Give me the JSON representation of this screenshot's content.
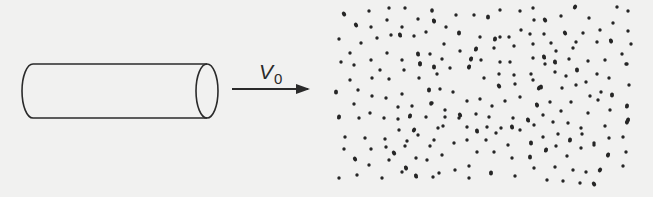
{
  "diagram": {
    "type": "physics-schematic",
    "colors": {
      "background": "#f1f1f0",
      "stroke": "#2a2a2a",
      "dots": "#262626"
    },
    "cylinder": {
      "x_left": 22,
      "x_right": 207,
      "y_top": 64,
      "y_bottom": 118,
      "cap_rx": 11
    },
    "arrow": {
      "x_start": 232,
      "x_end": 308,
      "y": 89,
      "label_main": "V",
      "label_sub": "0"
    },
    "particles": [
      [
        344,
        14
      ],
      [
        369,
        11
      ],
      [
        389,
        8
      ],
      [
        405,
        8
      ],
      [
        432,
        11
      ],
      [
        356,
        25
      ],
      [
        371,
        27
      ],
      [
        387,
        20
      ],
      [
        402,
        27
      ],
      [
        418,
        19
      ],
      [
        434,
        21
      ],
      [
        339,
        39
      ],
      [
        361,
        43
      ],
      [
        377,
        38
      ],
      [
        391,
        35
      ],
      [
        400,
        35
      ],
      [
        414,
        36
      ],
      [
        426,
        32
      ],
      [
        350,
        53
      ],
      [
        387,
        53
      ],
      [
        418,
        54
      ],
      [
        430,
        54
      ],
      [
        341,
        62
      ],
      [
        371,
        60
      ],
      [
        402,
        60
      ],
      [
        420,
        64
      ],
      [
        432,
        10
      ],
      [
        434,
        21
      ],
      [
        456,
        15
      ],
      [
        474,
        15
      ],
      [
        488,
        17
      ],
      [
        500,
        10
      ],
      [
        520,
        11
      ],
      [
        533,
        8
      ],
      [
        446,
        27
      ],
      [
        459,
        33
      ],
      [
        500,
        37
      ],
      [
        521,
        30
      ],
      [
        534,
        20
      ],
      [
        480,
        37
      ],
      [
        495,
        39
      ],
      [
        509,
        37
      ],
      [
        530,
        34
      ],
      [
        444,
        44
      ],
      [
        460,
        51
      ],
      [
        476,
        49
      ],
      [
        494,
        48
      ],
      [
        514,
        46
      ],
      [
        533,
        44
      ],
      [
        442,
        59
      ],
      [
        471,
        59
      ],
      [
        481,
        60
      ],
      [
        500,
        62
      ],
      [
        510,
        62
      ],
      [
        533,
        58
      ],
      [
        575,
        7
      ],
      [
        617,
        7
      ],
      [
        628,
        11
      ],
      [
        589,
        18
      ],
      [
        561,
        16
      ],
      [
        545,
        20
      ],
      [
        613,
        23
      ],
      [
        600,
        30
      ],
      [
        628,
        31
      ],
      [
        544,
        34
      ],
      [
        565,
        33
      ],
      [
        583,
        33
      ],
      [
        551,
        43
      ],
      [
        576,
        42
      ],
      [
        597,
        42
      ],
      [
        611,
        41
      ],
      [
        631,
        44
      ],
      [
        556,
        51
      ],
      [
        573,
        48
      ],
      [
        622,
        54
      ],
      [
        544,
        57
      ],
      [
        569,
        59
      ],
      [
        588,
        61
      ],
      [
        605,
        60
      ],
      [
        626,
        64
      ],
      [
        555,
        62
      ],
      [
        354,
        65
      ],
      [
        380,
        70
      ],
      [
        404,
        70
      ],
      [
        420,
        63
      ],
      [
        434,
        67
      ],
      [
        350,
        80
      ],
      [
        372,
        78
      ],
      [
        389,
        79
      ],
      [
        419,
        78
      ],
      [
        336,
        92
      ],
      [
        358,
        90
      ],
      [
        372,
        96
      ],
      [
        386,
        98
      ],
      [
        402,
        94
      ],
      [
        429,
        90
      ],
      [
        354,
        104
      ],
      [
        398,
        107
      ],
      [
        412,
        106
      ],
      [
        431,
        104
      ],
      [
        339,
        117
      ],
      [
        359,
        118
      ],
      [
        370,
        113
      ],
      [
        384,
        118
      ],
      [
        398,
        119
      ],
      [
        410,
        116
      ],
      [
        426,
        117
      ],
      [
        432,
        103
      ],
      [
        437,
        74
      ],
      [
        450,
        68
      ],
      [
        469,
        67
      ],
      [
        484,
        78
      ],
      [
        499,
        74
      ],
      [
        514,
        75
      ],
      [
        531,
        74
      ],
      [
        539,
        88
      ],
      [
        440,
        89
      ],
      [
        453,
        92
      ],
      [
        467,
        101
      ],
      [
        480,
        99
      ],
      [
        499,
        86
      ],
      [
        515,
        84
      ],
      [
        533,
        80
      ],
      [
        431,
        103
      ],
      [
        445,
        110
      ],
      [
        460,
        115
      ],
      [
        476,
        114
      ],
      [
        492,
        106
      ],
      [
        505,
        101
      ],
      [
        520,
        97
      ],
      [
        537,
        105
      ],
      [
        445,
        117
      ],
      [
        459,
        118
      ],
      [
        489,
        117
      ],
      [
        513,
        118
      ],
      [
        528,
        120
      ],
      [
        443,
        126
      ],
      [
        467,
        127
      ],
      [
        487,
        127
      ],
      [
        501,
        128
      ],
      [
        512,
        127
      ],
      [
        534,
        125
      ],
      [
        545,
        64
      ],
      [
        555,
        72
      ],
      [
        566,
        76
      ],
      [
        577,
        70
      ],
      [
        586,
        82
      ],
      [
        597,
        74
      ],
      [
        609,
        78
      ],
      [
        627,
        64
      ],
      [
        541,
        87
      ],
      [
        562,
        88
      ],
      [
        576,
        85
      ],
      [
        590,
        96
      ],
      [
        601,
        92
      ],
      [
        612,
        95
      ],
      [
        629,
        85
      ],
      [
        550,
        102
      ],
      [
        571,
        102
      ],
      [
        598,
        100
      ],
      [
        627,
        106
      ],
      [
        543,
        115
      ],
      [
        561,
        111
      ],
      [
        588,
        113
      ],
      [
        610,
        110
      ],
      [
        628,
        120
      ],
      [
        553,
        122
      ],
      [
        568,
        123
      ],
      [
        581,
        128
      ],
      [
        605,
        126
      ],
      [
        627,
        122
      ],
      [
        345,
        137
      ],
      [
        365,
        138
      ],
      [
        385,
        139
      ],
      [
        399,
        130
      ],
      [
        414,
        130
      ],
      [
        434,
        140
      ],
      [
        344,
        149
      ],
      [
        371,
        149
      ],
      [
        386,
        147
      ],
      [
        394,
        153
      ],
      [
        405,
        146
      ],
      [
        407,
        141
      ],
      [
        418,
        135
      ],
      [
        430,
        146
      ],
      [
        355,
        159
      ],
      [
        369,
        165
      ],
      [
        389,
        160
      ],
      [
        416,
        158
      ],
      [
        427,
        160
      ],
      [
        406,
        168
      ],
      [
        339,
        178
      ],
      [
        357,
        175
      ],
      [
        382,
        178
      ],
      [
        402,
        172
      ],
      [
        416,
        176
      ],
      [
        433,
        177
      ],
      [
        438,
        128
      ],
      [
        454,
        143
      ],
      [
        467,
        140
      ],
      [
        477,
        131
      ],
      [
        486,
        140
      ],
      [
        496,
        133
      ],
      [
        508,
        145
      ],
      [
        520,
        130
      ],
      [
        531,
        143
      ],
      [
        442,
        155
      ],
      [
        477,
        152
      ],
      [
        494,
        152
      ],
      [
        512,
        158
      ],
      [
        530,
        157
      ],
      [
        439,
        173
      ],
      [
        455,
        170
      ],
      [
        469,
        166
      ],
      [
        469,
        178
      ],
      [
        491,
        173
      ],
      [
        515,
        176
      ],
      [
        534,
        168
      ],
      [
        543,
        137
      ],
      [
        558,
        134
      ],
      [
        570,
        140
      ],
      [
        582,
        134
      ],
      [
        594,
        143
      ],
      [
        609,
        138
      ],
      [
        623,
        137
      ],
      [
        546,
        150
      ],
      [
        556,
        146
      ],
      [
        567,
        156
      ],
      [
        581,
        148
      ],
      [
        594,
        145
      ],
      [
        608,
        155
      ],
      [
        626,
        152
      ],
      [
        555,
        167
      ],
      [
        573,
        170
      ],
      [
        586,
        172
      ],
      [
        600,
        170
      ],
      [
        623,
        166
      ],
      [
        547,
        180
      ],
      [
        563,
        181
      ],
      [
        580,
        183
      ],
      [
        594,
        184
      ]
    ]
  }
}
